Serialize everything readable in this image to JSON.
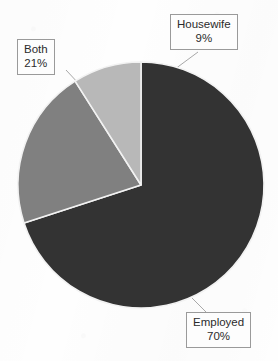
{
  "figure": {
    "background_color": "#ffffff",
    "label_box_border_color": "#9a9a9a",
    "label_text_color": "#2b2b2b",
    "leader_line_color": "#a8a8a8",
    "slice_outline_color": "#f2f2f2"
  },
  "chart_data": {
    "type": "pie",
    "title": "",
    "xlabel": "",
    "ylabel": "",
    "legend_position": "none",
    "grid": false,
    "units": "percent",
    "start_angle_deg": 0,
    "direction": "clockwise",
    "categories": [
      "Employed",
      "Both",
      "Housewife"
    ],
    "values": [
      70,
      21,
      9
    ],
    "colors": [
      "#333333",
      "#808080",
      "#b8b8b8"
    ],
    "slices": [
      {
        "label": "Employed",
        "value": 70,
        "value_text": "70%",
        "color": "#333333"
      },
      {
        "label": "Both",
        "value": 21,
        "value_text": "21%",
        "color": "#808080"
      },
      {
        "label": "Housewife",
        "value": 9,
        "value_text": "9%",
        "color": "#b8b8b8"
      }
    ]
  },
  "callouts": {
    "housewife": {
      "category": "Housewife",
      "percent": "9%"
    },
    "both": {
      "category": "Both",
      "percent": "21%"
    },
    "employed": {
      "category": "Employed",
      "percent": "70%"
    }
  }
}
